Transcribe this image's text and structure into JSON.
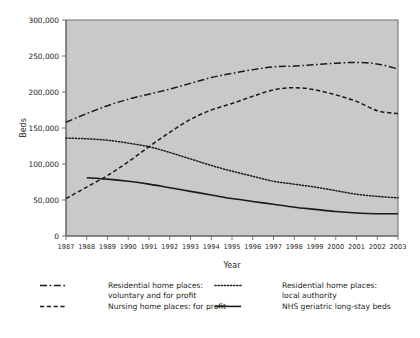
{
  "chart_data": {
    "type": "line",
    "title": "",
    "xlabel": "Year",
    "ylabel": "Beds",
    "grid": false,
    "legend_position": "bottom",
    "xlim": [
      1987,
      2003
    ],
    "ylim": [
      0,
      300000
    ],
    "ytick_labels": [
      "300,000",
      "250,000",
      "200,000",
      "150,000",
      "100,000",
      "50,000",
      "0"
    ],
    "ytick_values": [
      300000,
      250000,
      200000,
      150000,
      100000,
      50000,
      0
    ],
    "categories": [
      1987,
      1988,
      1989,
      1990,
      1991,
      1992,
      1993,
      1994,
      1995,
      1996,
      1997,
      1998,
      1999,
      2000,
      2001,
      2002,
      2003
    ],
    "xtick_labels": [
      "1987",
      "1988",
      "1989",
      "1990",
      "1991",
      "1992",
      "1993",
      "1994",
      "1995",
      "1996",
      "1997",
      "1998",
      "1999",
      "2000",
      "2001",
      "2002",
      "2003"
    ],
    "series": [
      {
        "name": "Residential home places: voluntary and for profit",
        "style": "dash-dot",
        "values": [
          158000,
          170000,
          181000,
          190000,
          197000,
          204000,
          212000,
          220000,
          226000,
          231000,
          235000,
          236000,
          238000,
          240000,
          241000,
          239000,
          232000
        ]
      },
      {
        "name": "Nursing home places: for profit",
        "style": "dashed",
        "values": [
          52000,
          68000,
          84000,
          103000,
          124000,
          144000,
          162000,
          175000,
          184000,
          194000,
          203000,
          206000,
          203000,
          196000,
          187000,
          174000,
          170000
        ]
      },
      {
        "name": "Residential home places: local authority",
        "style": "dotted",
        "values": [
          136000,
          135000,
          133000,
          129000,
          124000,
          116000,
          107000,
          98000,
          90000,
          83000,
          76000,
          72000,
          68000,
          63000,
          58000,
          55000,
          53000
        ]
      },
      {
        "name": "NHS geriatric long-stay beds",
        "style": "solid",
        "start_year": 1988,
        "values": [
          null,
          81000,
          79000,
          76000,
          72000,
          67000,
          62000,
          57000,
          52000,
          48000,
          44000,
          40000,
          37000,
          34000,
          32000,
          31000,
          31000
        ]
      }
    ]
  },
  "legend": {
    "entries": [
      {
        "label_line1": "Residential home places:",
        "label_line2": "voluntary and for profit",
        "style": "dash-dot"
      },
      {
        "label_line1": "Residential home places:",
        "label_line2": "local authority",
        "style": "dotted"
      },
      {
        "label_line1": "Nursing home places: for profit",
        "label_line2": "",
        "style": "dashed"
      },
      {
        "label_line1": "NHS geriatric long-stay beds",
        "label_line2": "",
        "style": "solid"
      }
    ]
  },
  "axes": {
    "y_title": "Beds",
    "x_title": "Year"
  },
  "colors": {
    "plot_background": "#c9c9c9",
    "line": "#1a1a1a",
    "frame": "#6d6d6d",
    "page_background": "#ffffff"
  }
}
